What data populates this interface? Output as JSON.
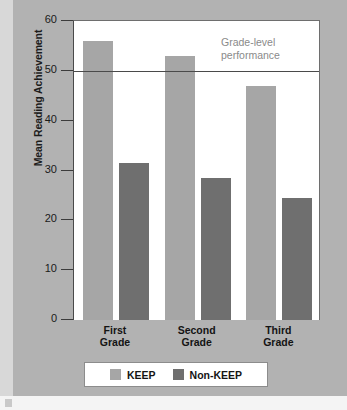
{
  "figure": {
    "background_color": "#b2b2b2",
    "plot_background_color": "#ffffff"
  },
  "chart_data": {
    "type": "bar",
    "title": "",
    "xlabel": "",
    "ylabel": "Mean Reading Achievement",
    "ylim": [
      0,
      60
    ],
    "yticks": [
      0,
      10,
      20,
      30,
      40,
      50,
      60
    ],
    "ytick_labels": [
      "0",
      "10",
      "20",
      "30",
      "40",
      "50",
      "60"
    ],
    "grid": false,
    "legend_position": "bottom",
    "categories": [
      "First\nGrade",
      "Second\nGrade",
      "Third\nGrade"
    ],
    "series": [
      {
        "name": "KEEP",
        "color": "#a6a6a6",
        "values": [
          56,
          53,
          47
        ]
      },
      {
        "name": "Non-KEEP",
        "color": "#6f6f6f",
        "values": [
          31.5,
          28.5,
          24.5
        ]
      }
    ],
    "annotations": [
      {
        "name": "grade-level-reference",
        "text": "Grade-level\nperformance",
        "y_value": 50,
        "color": "#8a8a8a",
        "line_color": "#4a4a4a"
      }
    ]
  },
  "legend": {
    "entries": [
      {
        "label": "KEEP",
        "color": "#a6a6a6"
      },
      {
        "label": "Non-KEEP",
        "color": "#6f6f6f"
      }
    ]
  }
}
